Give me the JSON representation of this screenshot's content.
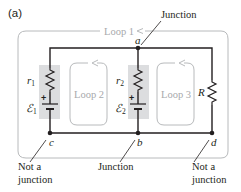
{
  "figure": {
    "panel_label": "(a)"
  },
  "colors": {
    "wire": "#231f20",
    "loop_outline": "#b8babc",
    "loop_text": "#a7a9ac",
    "shade": "#dcdddf",
    "text": "#231f20"
  },
  "loops": {
    "loop1": "Loop 1",
    "loop2": "Loop 2",
    "loop3": "Loop 3"
  },
  "nodes": {
    "a": "a",
    "b": "b",
    "c": "c",
    "d": "d"
  },
  "components": {
    "r1_sym": "r",
    "r1_sub": "1",
    "e1_sym": "ℰ",
    "e1_sub": "1",
    "r2_sym": "r",
    "r2_sub": "2",
    "e2_sym": "ℰ",
    "e2_sub": "2",
    "R": "R",
    "plus": "+"
  },
  "callouts": {
    "top_junction": "Junction",
    "bottom_junction": "Junction",
    "not_junction_left_line1": "Not a",
    "not_junction_left_line2": "junction",
    "not_junction_right_line1": "Not a",
    "not_junction_right_line2": "junction"
  }
}
